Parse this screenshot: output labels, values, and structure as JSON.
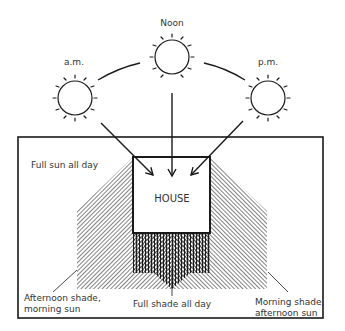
{
  "diagram": {
    "sun_labels": {
      "am": "a.m.",
      "noon": "Noon",
      "pm": "p.m."
    },
    "house_label": "HOUSE",
    "zones": {
      "full_sun": "Full sun all day",
      "afternoon_shade_line1": "Afternoon shade,",
      "afternoon_shade_line2": "morning sun",
      "full_shade": "Full shade all day",
      "morning_shade_line1": "Morning shade,",
      "morning_shade_line2": "afternoon sun"
    },
    "colors": {
      "ink": "#1a1a1a",
      "text": "#333333",
      "background": "#ffffff"
    }
  }
}
